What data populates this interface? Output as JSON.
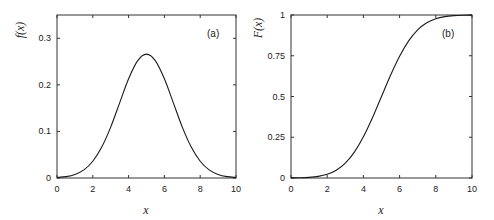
{
  "chart_data": [
    {
      "type": "line",
      "panel_label": "(a)",
      "xlabel": "x",
      "ylabel": "f(x)",
      "xlim": [
        0,
        10
      ],
      "ylim": [
        0,
        0.35
      ],
      "xticks": [
        0,
        2,
        4,
        6,
        8,
        10
      ],
      "xtick_labels": [
        "0",
        "2",
        "4",
        "6",
        "8",
        "10"
      ],
      "yticks": [
        0,
        0.1,
        0.2,
        0.3
      ],
      "ytick_labels": [
        "0",
        "0.1",
        "0.2",
        "0.3"
      ],
      "grid": false,
      "series": [
        {
          "name": "f(x)",
          "x": [
            0,
            0.5,
            1,
            1.5,
            2,
            2.5,
            3,
            3.5,
            4,
            4.5,
            5,
            5.5,
            6,
            6.5,
            7,
            7.5,
            8,
            8.5,
            9,
            9.5,
            10
          ],
          "y": [
            0.0011,
            0.0029,
            0.0076,
            0.0174,
            0.036,
            0.0664,
            0.1093,
            0.1613,
            0.213,
            0.2516,
            0.266,
            0.2516,
            0.213,
            0.1613,
            0.1093,
            0.0664,
            0.036,
            0.0174,
            0.0076,
            0.0029,
            0.0011
          ]
        }
      ]
    },
    {
      "type": "line",
      "panel_label": "(b)",
      "xlabel": "x",
      "ylabel": "F(x)",
      "xlim": [
        0,
        10
      ],
      "ylim": [
        0,
        1
      ],
      "xticks": [
        0,
        2,
        4,
        6,
        8,
        10
      ],
      "xtick_labels": [
        "0",
        "2",
        "4",
        "6",
        "8",
        "10"
      ],
      "yticks": [
        0,
        0.25,
        0.5,
        0.75,
        1
      ],
      "ytick_labels": [
        "0",
        "0.25",
        "0.5",
        "0.75",
        "1"
      ],
      "grid": false,
      "series": [
        {
          "name": "F(x)",
          "x": [
            0,
            0.5,
            1,
            1.5,
            2,
            2.5,
            3,
            3.5,
            4,
            4.5,
            5,
            5.5,
            6,
            6.5,
            7,
            7.5,
            8,
            8.5,
            9,
            9.5,
            10
          ],
          "y": [
            0.0004,
            0.0013,
            0.0038,
            0.0098,
            0.0228,
            0.0478,
            0.0912,
            0.1587,
            0.2525,
            0.3694,
            0.5,
            0.6306,
            0.7475,
            0.8413,
            0.9088,
            0.9522,
            0.9772,
            0.9902,
            0.9962,
            0.9987,
            0.9996
          ]
        }
      ]
    }
  ],
  "colors": {
    "line": "#1a1a1a",
    "frame": "#333333",
    "background": "#ffffff"
  }
}
